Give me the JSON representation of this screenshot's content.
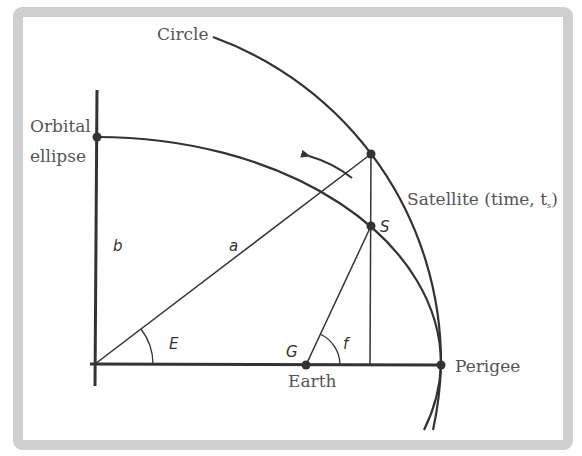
{
  "diagram": {
    "labels": {
      "circle": "Circle",
      "orbital": "Orbital",
      "ellipse": "ellipse",
      "satellite": "Satellite (time, t",
      "satellite_sub": "s",
      "satellite_close": ")",
      "perigee": "Perigee",
      "earth": "Earth",
      "semi_minor": "b",
      "semi_major": "a",
      "eccentric_anomaly": "E",
      "geocenter": "G",
      "true_anomaly": "f",
      "satellite_point": "S"
    },
    "geometry": {
      "center": [
        95,
        364
      ],
      "semi_major_px": 346,
      "semi_minor_px": 227,
      "earth_focus": [
        306,
        365
      ],
      "perigee": [
        441,
        365
      ],
      "circle_point": [
        371,
        154
      ],
      "satellite": [
        371,
        226
      ],
      "ellipse_top": [
        97,
        137
      ]
    },
    "colors": {
      "line": "#333333",
      "text": "#555555",
      "frame": "#cfcfcf",
      "background": "#ffffff"
    }
  }
}
